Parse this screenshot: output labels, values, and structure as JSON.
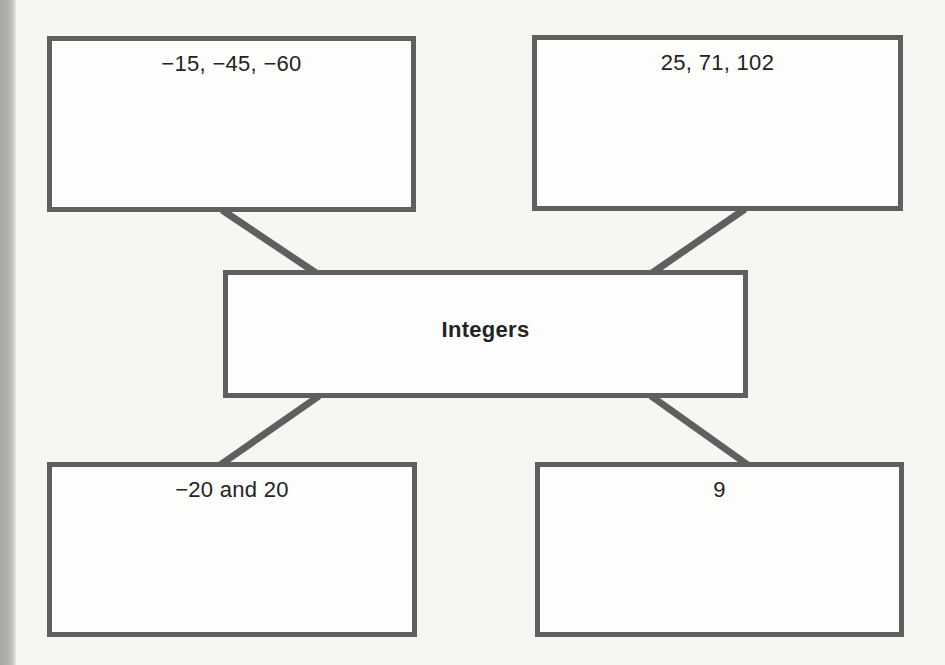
{
  "diagram": {
    "type": "concept-map",
    "center": {
      "label": "Integers"
    },
    "nodes": [
      {
        "position": "top-left",
        "label": "−15, −45, −60"
      },
      {
        "position": "top-right",
        "label": "25, 71, 102"
      },
      {
        "position": "bottom-left",
        "label": "−20 and 20"
      },
      {
        "position": "bottom-right",
        "label": "9"
      }
    ]
  },
  "colors": {
    "border": "#5f5f5f",
    "connector": "#5f5f5f",
    "background": "#f7f6f3",
    "text": "#232323"
  }
}
